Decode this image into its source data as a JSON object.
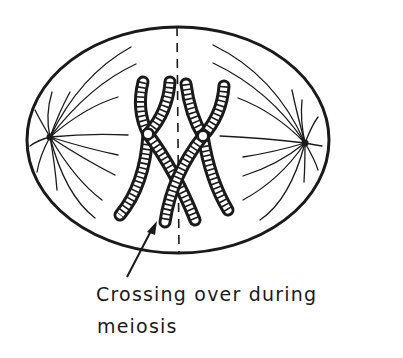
{
  "diagram": {
    "label": {
      "line1": "Crossing over during",
      "line2": "meiosis"
    },
    "elements": {
      "cell": "cell-membrane-ellipse",
      "equator": "metaphase-plate-dashed-line",
      "poles": [
        "left-spindle-pole",
        "right-spindle-pole"
      ],
      "chromosomes": [
        "left-homolog",
        "right-homolog"
      ],
      "arrow": "pointer-arrow-to-crossover"
    },
    "colors": {
      "ink": "#1a1a1a",
      "background": "#ffffff",
      "centromere": "#ffffff"
    }
  }
}
